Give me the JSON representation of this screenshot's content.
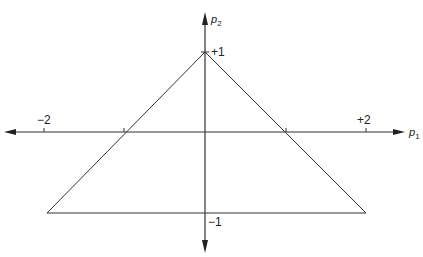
{
  "diagram": {
    "axes": {
      "x": {
        "label": "p",
        "subscript": "1",
        "range": [
          -2,
          2
        ]
      },
      "y": {
        "label": "p",
        "subscript": "2",
        "range": [
          -1,
          1
        ]
      }
    },
    "ticks": {
      "x_neg": "−2",
      "x_pos": "+2",
      "y_pos": "+1",
      "y_neg": "−1"
    },
    "triangle": {
      "vertices": [
        [
          0,
          1
        ],
        [
          -2,
          -1
        ],
        [
          2,
          -1
        ]
      ],
      "axis_intersections": [
        [
          -1,
          0
        ],
        [
          1,
          0
        ]
      ]
    },
    "colors": {
      "stroke": "#222222",
      "background": "#ffffff"
    }
  }
}
